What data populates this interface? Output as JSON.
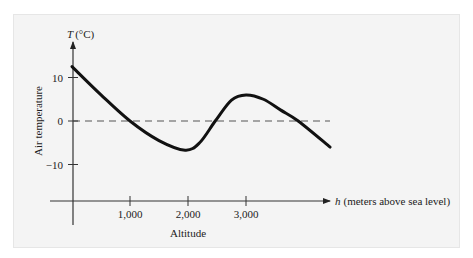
{
  "chart_data": {
    "type": "line",
    "title": "",
    "xlabel": "Altitude",
    "xaxis_label": "h (meters above sea level)",
    "xaxis_var": "h",
    "xaxis_unit": "(meters above sea level)",
    "ylabel": "Air temperature",
    "yaxis_label": "T (°C)",
    "yaxis_var": "T",
    "yaxis_unit": "(°C)",
    "x_ticks": [
      1000,
      2000,
      3000
    ],
    "x_tick_labels": [
      "1,000",
      "2,000",
      "3,000"
    ],
    "y_ticks": [
      10,
      0,
      -10
    ],
    "y_tick_labels": [
      "10",
      "0",
      "−10"
    ],
    "xlim": [
      0,
      4500
    ],
    "ylim": [
      -12,
      16
    ],
    "grid": false,
    "reference_line": {
      "y": 0,
      "style": "dashed"
    },
    "series": [
      {
        "name": "Air temperature",
        "x": [
          0,
          500,
          1000,
          1500,
          1950,
          2200,
          2470,
          2750,
          3000,
          3300,
          3600,
          3900,
          4450
        ],
        "y": [
          12.5,
          6,
          0,
          -4.5,
          -6.7,
          -5,
          0,
          4.8,
          6,
          5,
          2.5,
          0,
          -6
        ]
      }
    ]
  }
}
